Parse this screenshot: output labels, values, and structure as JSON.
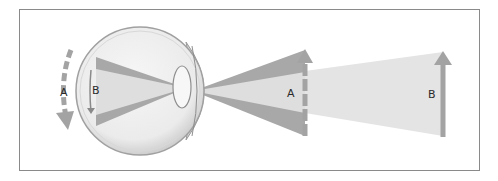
{
  "figure": {
    "labels": {
      "retina_movement": "A",
      "retina_image": "B",
      "near_object": "A",
      "far_object": "B"
    },
    "colors": {
      "frame_border": "#8a8a8a",
      "eye_fill": "#ececec",
      "eye_edge": "#9a9a9a",
      "dark_ray": "#a6a6a6",
      "light_ray": "#dedede",
      "arrow": "#a3a3a3",
      "label": "#2a2a2a"
    }
  }
}
